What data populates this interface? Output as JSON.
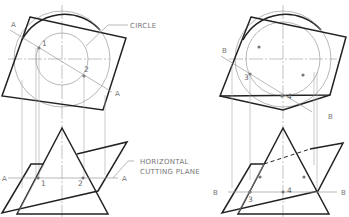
{
  "figure": {
    "left_view": {
      "callouts": {
        "circle": "CIRCLE",
        "plane_line1": "HORIZONTAL",
        "plane_line2": "CUTTING PLANE"
      },
      "cutting_line_labels": [
        "A",
        "A"
      ],
      "plane_labels": [
        "A",
        "A"
      ],
      "point_labels_top": [
        "1",
        "2"
      ],
      "point_labels_bottom": [
        "1",
        "2"
      ]
    },
    "right_view": {
      "cutting_line_labels": [
        "B",
        "B"
      ],
      "plane_labels": [
        "B",
        "B"
      ],
      "point_labels_top": [
        "3",
        "4"
      ],
      "point_labels_bottom": [
        "3",
        "4"
      ]
    }
  }
}
